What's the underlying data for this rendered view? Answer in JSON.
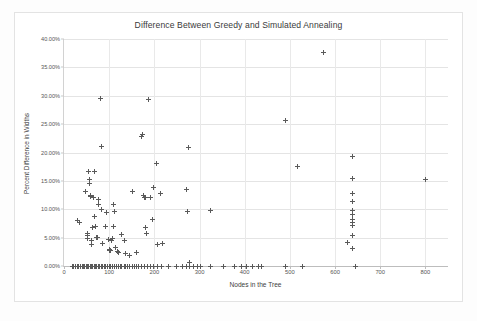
{
  "chart_data": {
    "type": "scatter",
    "title": "Difference Between Greedy and Simulated Annealing",
    "xlabel": "Nodes in the Tree",
    "ylabel": "Percent Difference in Widths",
    "xlim": [
      0,
      850
    ],
    "ylim": [
      0,
      0.4
    ],
    "xticks": [
      0,
      100,
      200,
      300,
      400,
      500,
      600,
      700,
      800
    ],
    "xtick_labels": [
      "0",
      "100",
      "200",
      "300",
      "400",
      "500",
      "600",
      "700",
      "800"
    ],
    "yticks": [
      0.0,
      0.05,
      0.1,
      0.15,
      0.2,
      0.25,
      0.3,
      0.35,
      0.4
    ],
    "ytick_labels": [
      "0.00%",
      "5.00%",
      "10.00%",
      "15.00%",
      "20.00%",
      "25.00%",
      "30.00%",
      "35.00%",
      "40.00%"
    ],
    "grid": true,
    "legend": false,
    "marker": "plus",
    "marker_color": "#5a5a5a",
    "series": [
      {
        "name": "Percent Difference in Widths",
        "points": [
          [
            18,
            0.0
          ],
          [
            22,
            0.0
          ],
          [
            26,
            0.0
          ],
          [
            30,
            0.0
          ],
          [
            33,
            0.0
          ],
          [
            36,
            0.0
          ],
          [
            40,
            0.0
          ],
          [
            43,
            0.0
          ],
          [
            46,
            0.0
          ],
          [
            49,
            0.0
          ],
          [
            52,
            0.0
          ],
          [
            55,
            0.0
          ],
          [
            58,
            0.0
          ],
          [
            61,
            0.0
          ],
          [
            64,
            0.0
          ],
          [
            67,
            0.0
          ],
          [
            70,
            0.0
          ],
          [
            73,
            0.0
          ],
          [
            76,
            0.0
          ],
          [
            79,
            0.0
          ],
          [
            82,
            0.0
          ],
          [
            85,
            0.0
          ],
          [
            89,
            0.0
          ],
          [
            92,
            0.0
          ],
          [
            96,
            0.0
          ],
          [
            100,
            0.0
          ],
          [
            104,
            0.0
          ],
          [
            108,
            0.0
          ],
          [
            112,
            0.0
          ],
          [
            116,
            0.0
          ],
          [
            120,
            0.0
          ],
          [
            124,
            0.0
          ],
          [
            128,
            0.0
          ],
          [
            133,
            0.0
          ],
          [
            137,
            0.0
          ],
          [
            141,
            0.0
          ],
          [
            146,
            0.0
          ],
          [
            151,
            0.0
          ],
          [
            156,
            0.0
          ],
          [
            161,
            0.0
          ],
          [
            166,
            0.0
          ],
          [
            172,
            0.0
          ],
          [
            178,
            0.0
          ],
          [
            184,
            0.0
          ],
          [
            191,
            0.0
          ],
          [
            198,
            0.0
          ],
          [
            206,
            0.0
          ],
          [
            216,
            0.0
          ],
          [
            232,
            0.0
          ],
          [
            249,
            0.0
          ],
          [
            262,
            0.0
          ],
          [
            272,
            0.0
          ],
          [
            278,
            0.0
          ],
          [
            286,
            0.0
          ],
          [
            295,
            0.0
          ],
          [
            302,
            0.0
          ],
          [
            325,
            0.0
          ],
          [
            352,
            0.0
          ],
          [
            378,
            0.0
          ],
          [
            392,
            0.0
          ],
          [
            404,
            0.0
          ],
          [
            418,
            0.0
          ],
          [
            431,
            0.0
          ],
          [
            438,
            0.0
          ],
          [
            491,
            0.0
          ],
          [
            528,
            0.0
          ],
          [
            645,
            0.0
          ],
          [
            30,
            0.08
          ],
          [
            34,
            0.077
          ],
          [
            47,
            0.132
          ],
          [
            52,
            0.057
          ],
          [
            52,
            0.053
          ],
          [
            53,
            0.049
          ],
          [
            55,
            0.166
          ],
          [
            56,
            0.152
          ],
          [
            57,
            0.146
          ],
          [
            58,
            0.125
          ],
          [
            59,
            0.122
          ],
          [
            60,
            0.045
          ],
          [
            61,
            0.038
          ],
          [
            63,
            0.067
          ],
          [
            66,
            0.12
          ],
          [
            67,
            0.166
          ],
          [
            68,
            0.087
          ],
          [
            69,
            0.07
          ],
          [
            72,
            0.051
          ],
          [
            74,
            0.05
          ],
          [
            76,
            0.117
          ],
          [
            77,
            0.108
          ],
          [
            80,
            0.295
          ],
          [
            82,
            0.211
          ],
          [
            84,
            0.099
          ],
          [
            86,
            0.04
          ],
          [
            92,
            0.07
          ],
          [
            95,
            0.095
          ],
          [
            98,
            0.047
          ],
          [
            100,
            0.029
          ],
          [
            101,
            0.027
          ],
          [
            103,
            0.028
          ],
          [
            106,
            0.045
          ],
          [
            107,
            0.048
          ],
          [
            109,
            0.069
          ],
          [
            110,
            0.108
          ],
          [
            112,
            0.096
          ],
          [
            115,
            0.032
          ],
          [
            118,
            0.026
          ],
          [
            121,
            0.024
          ],
          [
            128,
            0.056
          ],
          [
            133,
            0.045
          ],
          [
            137,
            0.022
          ],
          [
            146,
            0.019
          ],
          [
            151,
            0.131
          ],
          [
            160,
            0.024
          ],
          [
            172,
            0.229
          ],
          [
            174,
            0.232
          ],
          [
            176,
            0.125
          ],
          [
            178,
            0.12
          ],
          [
            180,
            0.121
          ],
          [
            181,
            0.068
          ],
          [
            183,
            0.057
          ],
          [
            186,
            0.293
          ],
          [
            191,
            0.12
          ],
          [
            196,
            0.082
          ],
          [
            199,
            0.139
          ],
          [
            204,
            0.18
          ],
          [
            208,
            0.038
          ],
          [
            214,
            0.128
          ],
          [
            218,
            0.039
          ],
          [
            272,
            0.135
          ],
          [
            274,
            0.096
          ],
          [
            276,
            0.209
          ],
          [
            278,
            0.007
          ],
          [
            325,
            0.098
          ],
          [
            491,
            0.256
          ],
          [
            516,
            0.176
          ],
          [
            575,
            0.377
          ],
          [
            628,
            0.042
          ],
          [
            638,
            0.193
          ],
          [
            638,
            0.155
          ],
          [
            638,
            0.128
          ],
          [
            638,
            0.113
          ],
          [
            638,
            0.098
          ],
          [
            638,
            0.09
          ],
          [
            638,
            0.082
          ],
          [
            638,
            0.077
          ],
          [
            638,
            0.071
          ],
          [
            638,
            0.053
          ],
          [
            638,
            0.031
          ],
          [
            800,
            0.153
          ]
        ]
      }
    ]
  }
}
